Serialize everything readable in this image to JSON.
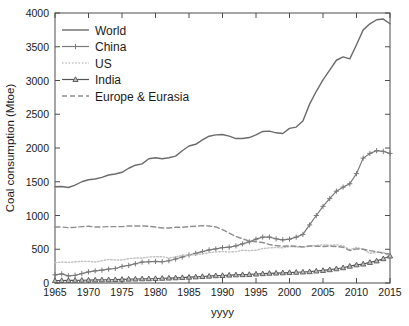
{
  "chart_data": {
    "type": "line",
    "title": "",
    "xlabel": "yyyy",
    "ylabel": "Coal consumption (Mtoe)",
    "xlim": [
      1965,
      2015
    ],
    "ylim": [
      0,
      4000
    ],
    "xticks": [
      1965,
      1970,
      1975,
      1980,
      1985,
      1990,
      1995,
      2000,
      2005,
      2010,
      2015
    ],
    "yticks": [
      0,
      500,
      1000,
      1500,
      2000,
      2500,
      3000,
      3500,
      4000
    ],
    "grid": false,
    "legend_position": "upper-left",
    "x": [
      1965,
      1966,
      1967,
      1968,
      1969,
      1970,
      1971,
      1972,
      1973,
      1974,
      1975,
      1976,
      1977,
      1978,
      1979,
      1980,
      1981,
      1982,
      1983,
      1984,
      1985,
      1986,
      1987,
      1988,
      1989,
      1990,
      1991,
      1992,
      1993,
      1994,
      1995,
      1996,
      1997,
      1998,
      1999,
      2000,
      2001,
      2002,
      2003,
      2004,
      2005,
      2006,
      2007,
      2008,
      2009,
      2010,
      2011,
      2012,
      2013,
      2014,
      2015
    ],
    "series": [
      {
        "name": "World",
        "color": "#6b6b6b",
        "style": "solid",
        "marker": "none",
        "values": [
          1425,
          1430,
          1415,
          1450,
          1500,
          1530,
          1540,
          1565,
          1600,
          1615,
          1640,
          1700,
          1745,
          1765,
          1840,
          1855,
          1840,
          1855,
          1880,
          1960,
          2030,
          2055,
          2120,
          2175,
          2195,
          2200,
          2175,
          2140,
          2140,
          2155,
          2195,
          2245,
          2250,
          2225,
          2215,
          2290,
          2310,
          2400,
          2650,
          2840,
          3010,
          3155,
          3300,
          3350,
          3320,
          3530,
          3750,
          3840,
          3900,
          3910,
          3840
        ]
      },
      {
        "name": "China",
        "color": "#7a7a7a",
        "style": "solid",
        "marker": "plus",
        "values": [
          120,
          135,
          105,
          115,
          140,
          165,
          180,
          190,
          205,
          215,
          245,
          260,
          285,
          310,
          315,
          320,
          315,
          330,
          355,
          385,
          415,
          440,
          465,
          490,
          505,
          525,
          530,
          550,
          580,
          610,
          650,
          680,
          680,
          655,
          640,
          650,
          680,
          720,
          860,
          1000,
          1135,
          1250,
          1360,
          1420,
          1470,
          1620,
          1850,
          1920,
          1960,
          1950,
          1920
        ]
      },
      {
        "name": "US",
        "color": "#c2c2c2",
        "style": "dotted",
        "marker": "none",
        "values": [
          300,
          310,
          305,
          315,
          320,
          320,
          310,
          330,
          350,
          340,
          340,
          360,
          370,
          370,
          385,
          390,
          390,
          370,
          385,
          410,
          415,
          420,
          430,
          450,
          460,
          465,
          460,
          465,
          485,
          480,
          485,
          510,
          520,
          525,
          520,
          540,
          535,
          530,
          545,
          555,
          565,
          560,
          565,
          550,
          495,
          525,
          500,
          440,
          455,
          455,
          395
        ]
      },
      {
        "name": "India",
        "color": "#555555",
        "style": "solid",
        "marker": "triangle",
        "values": [
          35,
          37,
          38,
          39,
          41,
          43,
          45,
          47,
          48,
          50,
          54,
          57,
          59,
          62,
          63,
          66,
          70,
          73,
          77,
          81,
          86,
          91,
          96,
          101,
          108,
          111,
          117,
          121,
          124,
          127,
          133,
          138,
          144,
          147,
          151,
          155,
          159,
          163,
          168,
          178,
          186,
          197,
          211,
          226,
          249,
          269,
          281,
          305,
          327,
          360,
          400
        ]
      },
      {
        "name": "Europe & Eurasia",
        "color": "#8f8f8f",
        "style": "dashed",
        "marker": "none",
        "values": [
          830,
          830,
          820,
          825,
          835,
          840,
          830,
          830,
          835,
          835,
          835,
          845,
          845,
          845,
          840,
          830,
          815,
          815,
          825,
          825,
          835,
          840,
          850,
          845,
          830,
          790,
          740,
          690,
          655,
          620,
          610,
          600,
          570,
          555,
          545,
          550,
          545,
          535,
          550,
          545,
          540,
          545,
          540,
          530,
          480,
          505,
          500,
          480,
          465,
          440,
          430
        ]
      }
    ]
  },
  "legend": {
    "items": [
      {
        "label": "World"
      },
      {
        "label": "China"
      },
      {
        "label": "US"
      },
      {
        "label": "India"
      },
      {
        "label": "Europe & Eurasia"
      }
    ]
  }
}
